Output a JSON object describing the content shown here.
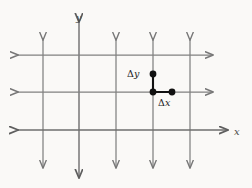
{
  "figure": {
    "background_color": "#faf9f7",
    "grid_color": "#808080",
    "axis_color": "#6e6e6e",
    "accent_color": "#111111"
  },
  "axes": {
    "y_label": "y",
    "x_label": "x",
    "y_axis_x": 79,
    "x_axis_y": 130
  },
  "grid": {
    "vertical_lines_x": [
      43,
      79,
      116,
      153,
      190
    ],
    "horizontal_lines_y": [
      55,
      92,
      130
    ],
    "vertical_top": 40,
    "vertical_bottom": 168,
    "horizontal_left": 18,
    "horizontal_right": 213,
    "x_axis_right": 228,
    "y_axis_top": 22,
    "y_axis_bottom": 178
  },
  "increments": {
    "delta_y": {
      "symbol": "Δ",
      "variable": "y",
      "label": "Δy",
      "from": {
        "x": 153,
        "y": 92
      },
      "to": {
        "x": 153,
        "y": 74
      }
    },
    "delta_x": {
      "symbol": "Δ",
      "variable": "x",
      "label": "Δx",
      "from": {
        "x": 153,
        "y": 92
      },
      "to": {
        "x": 172,
        "y": 92
      }
    }
  },
  "points": [
    {
      "name": "point-top",
      "x": 153,
      "y": 74,
      "radius": 3.4
    },
    {
      "name": "point-corner",
      "x": 153,
      "y": 92,
      "radius": 3.4
    },
    {
      "name": "point-right",
      "x": 172,
      "y": 92,
      "radius": 3.4
    }
  ]
}
